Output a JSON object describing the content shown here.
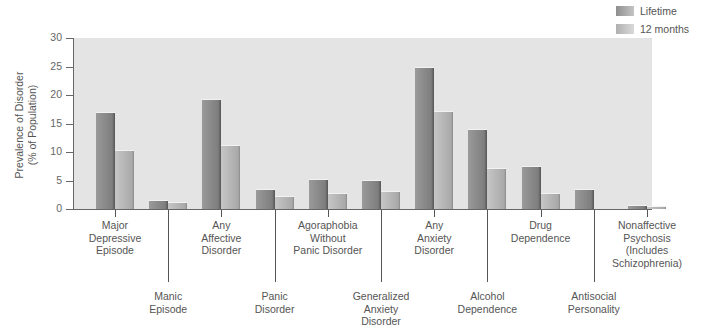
{
  "legend": [
    {
      "label": "Lifetime",
      "color": "#8e8e8e"
    },
    {
      "label": "12 months",
      "color": "#c4c4c4"
    }
  ],
  "y_axis": {
    "label_line1": "Prevalence of Disorder",
    "label_line2": "(% of Population)",
    "ticks": [
      "30",
      "25",
      "20",
      "15",
      "10",
      "5",
      "0"
    ]
  },
  "categories": [
    {
      "label_lines": [
        "Major",
        "Depressive",
        "Episode"
      ],
      "row": "upper"
    },
    {
      "label_lines": [
        "Manic",
        "Episode"
      ],
      "row": "lower"
    },
    {
      "label_lines": [
        "Any",
        "Affective",
        "Disorder"
      ],
      "row": "upper"
    },
    {
      "label_lines": [
        "Panic",
        "Disorder"
      ],
      "row": "lower"
    },
    {
      "label_lines": [
        "Agoraphobia",
        "Without",
        "Panic Disorder"
      ],
      "row": "upper"
    },
    {
      "label_lines": [
        "Generalized",
        "Anxiety",
        "Disorder"
      ],
      "row": "lower"
    },
    {
      "label_lines": [
        "Any",
        "Anxiety",
        "Disorder"
      ],
      "row": "upper"
    },
    {
      "label_lines": [
        "Alcohol",
        "Dependence"
      ],
      "row": "lower"
    },
    {
      "label_lines": [
        "Drug",
        "Dependence"
      ],
      "row": "upper"
    },
    {
      "label_lines": [
        "Antisocial",
        "Personality"
      ],
      "row": "lower"
    },
    {
      "label_lines": [
        "Nonaffective",
        "Psychosis",
        "(Includes",
        "Schizophrenia)"
      ],
      "row": "upper"
    }
  ],
  "chart_data": {
    "type": "bar",
    "title": "",
    "xlabel": "",
    "ylabel": "Prevalence of Disorder (% of Population)",
    "ylim": [
      0,
      30
    ],
    "yticks": [
      0,
      5,
      10,
      15,
      20,
      25,
      30
    ],
    "grid": false,
    "legend_position": "top-right",
    "categories": [
      "Major Depressive Episode",
      "Manic Episode",
      "Any Affective Disorder",
      "Panic Disorder",
      "Agoraphobia Without Panic Disorder",
      "Generalized Anxiety Disorder",
      "Any Anxiety Disorder",
      "Alcohol Dependence",
      "Drug Dependence",
      "Antisocial Personality",
      "Nonaffective Psychosis (Includes Schizophrenia)"
    ],
    "series": [
      {
        "name": "Lifetime",
        "values": [
          17.1,
          1.6,
          19.3,
          3.5,
          5.3,
          5.1,
          24.9,
          14.1,
          7.5,
          3.5,
          0.7
        ]
      },
      {
        "name": "12 months",
        "values": [
          10.3,
          1.3,
          11.3,
          2.3,
          2.8,
          3.1,
          17.2,
          7.2,
          2.8,
          null,
          0.5
        ]
      }
    ]
  }
}
